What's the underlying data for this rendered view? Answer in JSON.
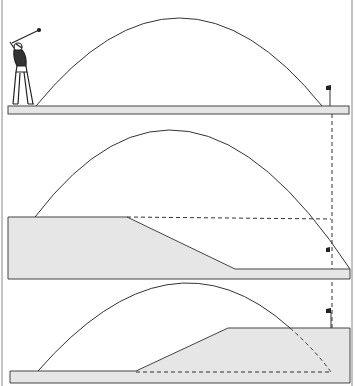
{
  "diagram": {
    "panels": [
      {
        "name": "level",
        "terrain": "level"
      },
      {
        "name": "downhill",
        "terrain": "elevated tee to lower green"
      },
      {
        "name": "uphill",
        "terrain": "low tee to elevated green"
      }
    ],
    "colors": {
      "terrain_fill": "#e6e6e6",
      "line": "#333333",
      "background": "#ffffff"
    }
  }
}
